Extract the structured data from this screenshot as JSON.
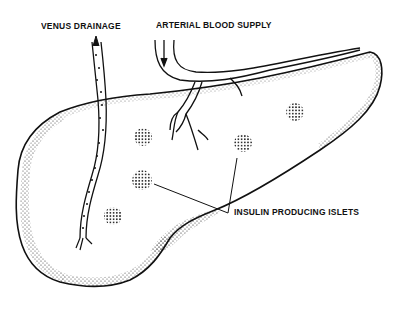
{
  "diagram": {
    "labels": {
      "venus_drainage": "VENUS DRAINAGE",
      "arterial_blood_supply": "ARTERIAL BLOOD SUPPLY",
      "insulin_producing_islets": "INSULIN PRODUCING ISLETS"
    },
    "islets": [
      {
        "cx": 143,
        "cy": 137,
        "r": 9
      },
      {
        "cx": 243,
        "cy": 143,
        "r": 9
      },
      {
        "cx": 295,
        "cy": 112,
        "r": 9
      },
      {
        "cx": 142,
        "cy": 180,
        "r": 10
      },
      {
        "cx": 113,
        "cy": 216,
        "r": 9
      }
    ],
    "colors": {
      "ink": "#111111",
      "background": "#ffffff"
    }
  }
}
